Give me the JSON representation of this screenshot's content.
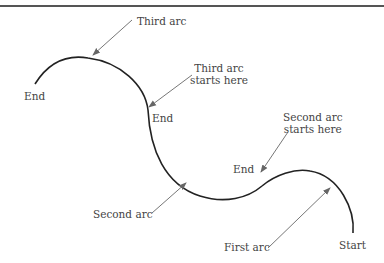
{
  "diagram": {
    "type": "connected arcs path diagram",
    "labels": {
      "third_arc": "Third arc",
      "third_arc_starts_1": "Third arc",
      "third_arc_starts_2": "starts here",
      "second_arc_starts_1": "Second arc",
      "second_arc_starts_2": "starts here",
      "second_arc": "Second arc",
      "first_arc": "First arc",
      "end_left": "End",
      "end_mid": "End",
      "end_right": "End",
      "start": "Start"
    },
    "colors": {
      "curve": "#222222",
      "arrow": "#777777",
      "text": "#444444",
      "rule": "#555555"
    }
  }
}
